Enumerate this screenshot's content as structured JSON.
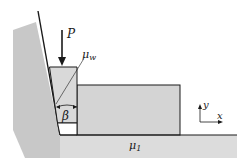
{
  "diagram": {
    "labels": {
      "force": "P",
      "wall_friction": "μ",
      "wall_friction_sub": "w",
      "angle": "β",
      "floor_friction": "μ",
      "floor_friction_sub": "1",
      "axis_x": "x",
      "axis_y": "y"
    },
    "colors": {
      "wall_fill": "#c8c8c8",
      "wedge_fill": "#d9d9d9",
      "block_fill": "#d4d4d4",
      "floor_fill": "#dcdcdc",
      "line": "#1a1a1a",
      "background": "#ffffff"
    }
  }
}
